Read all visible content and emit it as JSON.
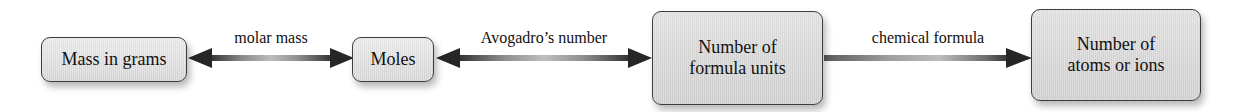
{
  "diagram": {
    "type": "flow-diagram",
    "colors": {
      "box_fill": "#d6d6d6",
      "box_border": "#3d3d3d",
      "arrow_dark": "#2e2e2e",
      "arrow_light": "#b4b4b4",
      "text": "#111111",
      "background": "#ffffff"
    },
    "nodes": [
      {
        "id": "mass",
        "label": "Mass in grams"
      },
      {
        "id": "moles",
        "label": "Moles"
      },
      {
        "id": "units",
        "label": "Number of\nformula units"
      },
      {
        "id": "atoms",
        "label": "Number of\natoms or ions"
      }
    ],
    "edges": [
      {
        "id": "molar",
        "label": "molar mass",
        "from": "mass",
        "to": "moles",
        "direction": "bidirectional"
      },
      {
        "id": "avo",
        "label": "Avogadro’s number",
        "from": "moles",
        "to": "units",
        "direction": "bidirectional"
      },
      {
        "id": "chem",
        "label": "chemical formula",
        "from": "units",
        "to": "atoms",
        "direction": "right"
      }
    ]
  }
}
